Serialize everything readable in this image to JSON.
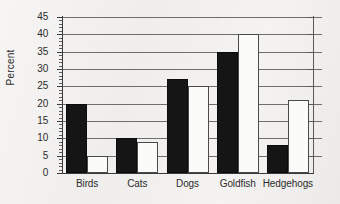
{
  "chart_data": {
    "type": "bar",
    "title": "",
    "xlabel": "",
    "ylabel": "Percent",
    "ylim": [
      0,
      45
    ],
    "ytick_step": 5,
    "yminor_step": 1,
    "grid": "horizontal-major",
    "legend": "none",
    "categories": [
      "Birds",
      "Cats",
      "Dogs",
      "Goldfish",
      "Hedgehogs"
    ],
    "ytick_labels": [
      "0",
      "5",
      "10",
      "15",
      "20",
      "25",
      "30",
      "35",
      "40",
      "45"
    ],
    "series": [
      {
        "name": "black",
        "color": "#151515",
        "values": [
          20,
          10,
          27,
          35,
          8
        ]
      },
      {
        "name": "white",
        "color": "#fbfbfa",
        "values": [
          5,
          9,
          25,
          40,
          21
        ]
      }
    ]
  },
  "axes": {
    "y_title": "Percent",
    "ticks": [
      {
        "value": 45,
        "label": "45"
      },
      {
        "value": 40,
        "label": "40"
      },
      {
        "value": 35,
        "label": "35"
      },
      {
        "value": 30,
        "label": "30"
      },
      {
        "value": 25,
        "label": "25"
      },
      {
        "value": 20,
        "label": "20"
      },
      {
        "value": 15,
        "label": "15"
      },
      {
        "value": 10,
        "label": "10"
      },
      {
        "value": 5,
        "label": "5"
      },
      {
        "value": 0,
        "label": "0"
      }
    ]
  },
  "groups": [
    {
      "label": "Birds",
      "dark": 20,
      "light": 5
    },
    {
      "label": "Cats",
      "dark": 10,
      "light": 9
    },
    {
      "label": "Dogs",
      "dark": 27,
      "light": 25
    },
    {
      "label": "Goldfish",
      "dark": 35,
      "light": 40
    },
    {
      "label": "Hedgehogs",
      "dark": 8,
      "light": 21
    }
  ]
}
